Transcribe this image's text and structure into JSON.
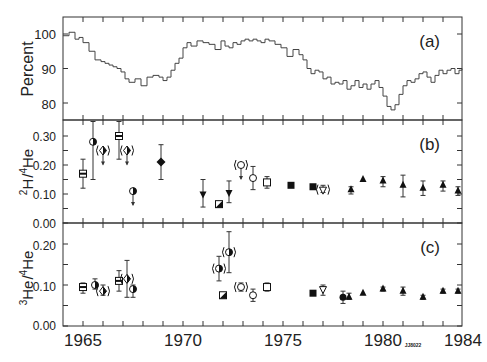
{
  "chart_data": [
    {
      "panel": "(a)",
      "type": "line",
      "ylabel": "Percent",
      "ylim": [
        75.5,
        105.5
      ],
      "yticks": [
        80,
        90,
        100
      ],
      "xlim": [
        1964,
        1984
      ],
      "step": true,
      "x": [
        1964.0,
        1964.3,
        1964.6,
        1964.8,
        1965.0,
        1965.3,
        1965.6,
        1965.9,
        1966.1,
        1966.3,
        1966.5,
        1966.7,
        1966.9,
        1967.1,
        1967.3,
        1967.6,
        1967.9,
        1968.2,
        1968.5,
        1968.8,
        1969.0,
        1969.2,
        1969.4,
        1969.6,
        1969.8,
        1970.0,
        1970.2,
        1970.4,
        1970.7,
        1971.0,
        1971.3,
        1971.6,
        1971.9,
        1972.1,
        1972.3,
        1972.5,
        1972.7,
        1972.9,
        1973.1,
        1973.3,
        1973.5,
        1973.7,
        1973.9,
        1974.1,
        1974.3,
        1974.6,
        1974.9,
        1975.2,
        1975.5,
        1975.8,
        1976.0,
        1976.2,
        1976.4,
        1976.6,
        1976.8,
        1977.0,
        1977.2,
        1977.4,
        1977.6,
        1977.8,
        1978.0,
        1978.2,
        1978.4,
        1978.6,
        1978.8,
        1979.0,
        1979.2,
        1979.4,
        1979.6,
        1979.8,
        1980.0,
        1980.2,
        1980.4,
        1980.6,
        1980.8,
        1981.0,
        1981.2,
        1981.4,
        1981.6,
        1981.8,
        1982.0,
        1982.2,
        1982.4,
        1982.6,
        1982.8,
        1983.0,
        1983.2,
        1983.4,
        1983.6,
        1983.8,
        1984.0
      ],
      "values": [
        99.5,
        100.5,
        98.5,
        99.0,
        97.5,
        95.0,
        92.5,
        92.0,
        91.5,
        91.0,
        90.5,
        90.0,
        89.0,
        87.0,
        86.0,
        87.0,
        85.0,
        87.5,
        88.0,
        87.5,
        86.5,
        87.5,
        89.5,
        91.5,
        93.0,
        96.0,
        97.5,
        96.5,
        98.0,
        97.5,
        97.0,
        95.5,
        98.0,
        96.5,
        96.0,
        97.5,
        97.0,
        98.0,
        98.5,
        98.0,
        98.5,
        98.0,
        97.5,
        98.5,
        98.0,
        97.0,
        96.0,
        93.5,
        95.5,
        94.0,
        92.5,
        90.0,
        88.5,
        89.5,
        89.0,
        87.0,
        87.5,
        85.5,
        86.0,
        85.5,
        86.5,
        84.0,
        85.0,
        86.5,
        84.5,
        85.5,
        84.0,
        85.5,
        86.5,
        84.5,
        82.0,
        79.0,
        78.0,
        79.5,
        82.5,
        85.0,
        86.5,
        86.0,
        87.0,
        88.5,
        89.0,
        87.5,
        86.0,
        88.0,
        89.5,
        88.5,
        89.5,
        90.0,
        88.5,
        89.5,
        90.0
      ],
      "annotation": "(a)"
    },
    {
      "panel": "(b)",
      "type": "scatter",
      "ylabel": "2H/4He",
      "ylim": [
        0.0,
        0.35
      ],
      "yticks": [
        0.0,
        0.1,
        0.2,
        0.3
      ],
      "points": [
        {
          "x": 1965.0,
          "y": 0.17,
          "lo": 0.12,
          "hi": 0.22,
          "marker": "square-half"
        },
        {
          "x": 1965.5,
          "y": 0.28,
          "lo": 0.15,
          "hi": 0.35,
          "marker": "circle-half"
        },
        {
          "x": 1966.0,
          "y": 0.25,
          "arrow": true,
          "marker": "paren-diamond"
        },
        {
          "x": 1966.8,
          "y": 0.3,
          "lo": 0.22,
          "hi": 0.35,
          "marker": "square-half"
        },
        {
          "x": 1967.2,
          "y": 0.25,
          "arrow": true,
          "marker": "paren-diamond"
        },
        {
          "x": 1967.5,
          "y": 0.11,
          "arrow": true,
          "marker": "circle-half"
        },
        {
          "x": 1968.9,
          "y": 0.21,
          "lo": 0.15,
          "hi": 0.27,
          "marker": "diamond-filled"
        },
        {
          "x": 1971.0,
          "y": 0.1,
          "lo": 0.055,
          "hi": 0.15,
          "marker": "triangle-down-filled"
        },
        {
          "x": 1971.8,
          "y": 0.065,
          "marker": "square-hatched"
        },
        {
          "x": 1972.3,
          "y": 0.105,
          "lo": 0.07,
          "hi": 0.145,
          "marker": "triangle-down-filled"
        },
        {
          "x": 1972.9,
          "y": 0.2,
          "arrow": true,
          "marker": "paren-circle"
        },
        {
          "x": 1973.5,
          "y": 0.155,
          "lo": 0.115,
          "hi": 0.195,
          "marker": "circle-open"
        },
        {
          "x": 1974.2,
          "y": 0.14,
          "lo": 0.12,
          "hi": 0.16,
          "marker": "square-open"
        },
        {
          "x": 1975.4,
          "y": 0.13,
          "marker": "square-filled"
        },
        {
          "x": 1976.5,
          "y": 0.125,
          "marker": "square-filled"
        },
        {
          "x": 1977.0,
          "y": 0.115,
          "lo": 0.105,
          "hi": 0.13,
          "marker": "paren-triangle-down"
        },
        {
          "x": 1978.4,
          "y": 0.115,
          "lo": 0.1,
          "hi": 0.125,
          "marker": "triangle-filled"
        },
        {
          "x": 1979.0,
          "y": 0.15,
          "marker": "triangle-filled"
        },
        {
          "x": 1980.0,
          "y": 0.145,
          "lo": 0.125,
          "hi": 0.16,
          "marker": "triangle-filled"
        },
        {
          "x": 1981.0,
          "y": 0.13,
          "lo": 0.09,
          "hi": 0.165,
          "marker": "triangle-filled"
        },
        {
          "x": 1982.0,
          "y": 0.12,
          "lo": 0.095,
          "hi": 0.145,
          "marker": "triangle-filled"
        },
        {
          "x": 1983.0,
          "y": 0.13,
          "lo": 0.11,
          "hi": 0.145,
          "marker": "triangle-filled"
        },
        {
          "x": 1984.0,
          "y": 0.11,
          "lo": 0.095,
          "hi": 0.125,
          "marker": "triangle-filled"
        }
      ],
      "annotation": "(b)"
    },
    {
      "panel": "(c)",
      "type": "scatter",
      "ylabel": "3He/4He",
      "ylim": [
        0.0,
        0.25
      ],
      "yticks": [
        0.0,
        0.1,
        0.2
      ],
      "xlabel": "",
      "xticks": [
        1965,
        1970,
        1975,
        1980,
        1984
      ],
      "points": [
        {
          "x": 1965.0,
          "y": 0.095,
          "lo": 0.08,
          "hi": 0.105,
          "marker": "square-half"
        },
        {
          "x": 1965.6,
          "y": 0.1,
          "lo": 0.09,
          "hi": 0.115,
          "marker": "circle-half"
        },
        {
          "x": 1966.0,
          "y": 0.085,
          "lo": 0.075,
          "hi": 0.1,
          "marker": "paren-diamond"
        },
        {
          "x": 1966.8,
          "y": 0.11,
          "lo": 0.085,
          "hi": 0.135,
          "marker": "square-half"
        },
        {
          "x": 1967.2,
          "y": 0.115,
          "lo": 0.07,
          "hi": 0.16,
          "marker": "paren-diamond"
        },
        {
          "x": 1967.5,
          "y": 0.09,
          "lo": 0.07,
          "hi": 0.1,
          "marker": "circle-half"
        },
        {
          "x": 1971.8,
          "y": 0.14,
          "lo": 0.11,
          "hi": 0.17,
          "marker": "paren-circle-half"
        },
        {
          "x": 1972.0,
          "y": 0.075,
          "marker": "square-quarter"
        },
        {
          "x": 1972.3,
          "y": 0.18,
          "lo": 0.13,
          "hi": 0.23,
          "marker": "paren-circle-half"
        },
        {
          "x": 1972.9,
          "y": 0.095,
          "lo": 0.085,
          "hi": 0.105,
          "marker": "paren-circle"
        },
        {
          "x": 1973.5,
          "y": 0.075,
          "lo": 0.06,
          "hi": 0.09,
          "marker": "circle-open"
        },
        {
          "x": 1974.2,
          "y": 0.095,
          "lo": 0.085,
          "hi": 0.105,
          "marker": "square-open"
        },
        {
          "x": 1976.5,
          "y": 0.08,
          "marker": "square-filled"
        },
        {
          "x": 1977.0,
          "y": 0.09,
          "lo": 0.075,
          "hi": 0.1,
          "marker": "triangle-down-open"
        },
        {
          "x": 1978.0,
          "y": 0.07,
          "lo": 0.055,
          "hi": 0.085,
          "marker": "circle-filled"
        },
        {
          "x": 1978.3,
          "y": 0.07,
          "lo": 0.065,
          "hi": 0.08,
          "marker": "triangle-filled"
        },
        {
          "x": 1979.0,
          "y": 0.08,
          "marker": "triangle-filled"
        },
        {
          "x": 1980.0,
          "y": 0.09,
          "lo": 0.085,
          "hi": 0.095,
          "marker": "triangle-filled"
        },
        {
          "x": 1981.0,
          "y": 0.085,
          "lo": 0.075,
          "hi": 0.095,
          "marker": "triangle-filled"
        },
        {
          "x": 1982.0,
          "y": 0.07,
          "lo": 0.065,
          "hi": 0.075,
          "marker": "triangle-filled"
        },
        {
          "x": 1983.0,
          "y": 0.085,
          "lo": 0.08,
          "hi": 0.09,
          "marker": "triangle-filled"
        },
        {
          "x": 1984.0,
          "y": 0.085,
          "lo": 0.08,
          "hi": 0.09,
          "marker": "triangle-filled"
        }
      ],
      "annotation": "(c)"
    }
  ],
  "axes": {
    "panel_a": {
      "ylabel": "Percent",
      "tick_labels": [
        "100",
        "90",
        "80"
      ],
      "tag": "(a)"
    },
    "panel_b": {
      "ylabel_main": "H",
      "ylabel_sup1": "2",
      "ylabel_sup2": "4",
      "ylabel_tail": "He",
      "tick_labels": [
        "0.30",
        "0.20",
        "0.10",
        "0.00"
      ],
      "tag": "(b)"
    },
    "panel_c": {
      "ylabel_main": "He",
      "ylabel_sup1": "3",
      "ylabel_sup2": "4",
      "ylabel_tail": "He",
      "tick_labels": [
        "0.20",
        "0.10",
        "0.00"
      ],
      "tag": "(c)"
    },
    "x_tick_labels": [
      "1965",
      "1970",
      "1975",
      "1980",
      "1984"
    ]
  },
  "figure_code": "JJ8022"
}
